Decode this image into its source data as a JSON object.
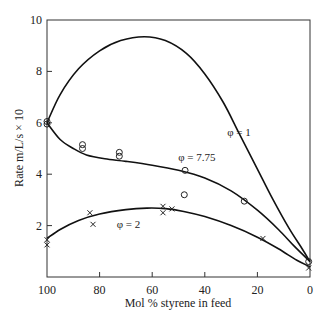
{
  "chart_data": {
    "type": "line",
    "title": "",
    "xlabel": "Mol % styrene in feed",
    "ylabel": "Rate m/L/s × 10",
    "xlim": [
      100,
      0
    ],
    "ylim": [
      0,
      10
    ],
    "x_reversed": true,
    "grid": false,
    "legend": "none (inline curve labels)",
    "xticks": [
      100,
      80,
      60,
      40,
      20,
      0
    ],
    "yticks": [
      2,
      4,
      6,
      8,
      10
    ],
    "curves": [
      {
        "name": "φ = 1",
        "label": "φ = 1",
        "label_pos": {
          "x": 27,
          "y": 5.5
        },
        "points": [
          [
            100,
            6.0
          ],
          [
            95,
            7.1
          ],
          [
            88,
            8.1
          ],
          [
            80,
            8.8
          ],
          [
            72,
            9.2
          ],
          [
            63,
            9.35
          ],
          [
            55,
            9.2
          ],
          [
            47,
            8.7
          ],
          [
            40,
            7.9
          ],
          [
            33,
            6.8
          ],
          [
            27,
            5.6
          ],
          [
            20,
            4.2
          ],
          [
            14,
            3.0
          ],
          [
            8,
            1.9
          ],
          [
            3,
            1.1
          ],
          [
            0,
            0.6
          ]
        ]
      },
      {
        "name": "φ = 7.75",
        "label": "φ = 7.75",
        "label_pos": {
          "x": 43,
          "y": 4.5
        },
        "points": [
          [
            100,
            6.0
          ],
          [
            95,
            5.35
          ],
          [
            90,
            5.0
          ],
          [
            85,
            4.75
          ],
          [
            78,
            4.6
          ],
          [
            70,
            4.5
          ],
          [
            60,
            4.35
          ],
          [
            50,
            4.15
          ],
          [
            40,
            3.85
          ],
          [
            30,
            3.35
          ],
          [
            20,
            2.6
          ],
          [
            12,
            1.85
          ],
          [
            6,
            1.2
          ],
          [
            0,
            0.6
          ]
        ]
      },
      {
        "name": "φ = 2",
        "label": "φ = 2",
        "label_pos": {
          "x": 69,
          "y": 1.9
        },
        "points": [
          [
            100,
            1.5
          ],
          [
            95,
            1.85
          ],
          [
            88,
            2.2
          ],
          [
            80,
            2.45
          ],
          [
            70,
            2.62
          ],
          [
            62,
            2.68
          ],
          [
            55,
            2.66
          ],
          [
            48,
            2.55
          ],
          [
            40,
            2.35
          ],
          [
            30,
            2.0
          ],
          [
            20,
            1.55
          ],
          [
            12,
            1.1
          ],
          [
            5,
            0.65
          ],
          [
            0,
            0.4
          ]
        ]
      }
    ],
    "markers": {
      "circles": [
        [
          100,
          6.05
        ],
        [
          100,
          5.95
        ],
        [
          86.5,
          5.15
        ],
        [
          86.5,
          5.0
        ],
        [
          72.5,
          4.85
        ],
        [
          72.5,
          4.7
        ],
        [
          47.5,
          4.15
        ],
        [
          47.8,
          3.2
        ],
        [
          25,
          2.95
        ],
        [
          0.5,
          0.6
        ]
      ],
      "crosses": [
        [
          100,
          1.45
        ],
        [
          100,
          1.25
        ],
        [
          83.7,
          2.5
        ],
        [
          82.5,
          2.05
        ],
        [
          55.9,
          2.75
        ],
        [
          55.9,
          2.5
        ],
        [
          52.5,
          2.65
        ],
        [
          17.9,
          1.5
        ],
        [
          0.5,
          0.35
        ]
      ]
    }
  }
}
